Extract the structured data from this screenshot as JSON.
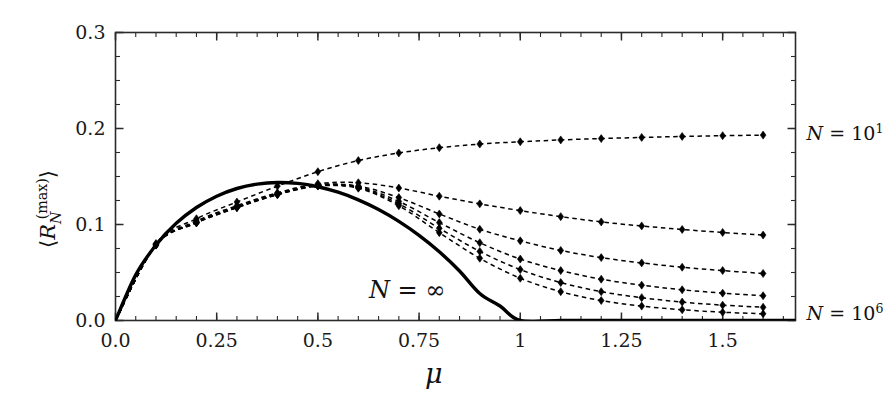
{
  "chart_data": {
    "type": "line",
    "title": "",
    "subtitle": "",
    "xlabel": "μ",
    "ylabel": "⟨R_N^(max)⟩",
    "xlim": [
      0.0,
      1.68
    ],
    "ylim": [
      0.0,
      0.3
    ],
    "xticks": [
      0.0,
      0.25,
      0.5,
      0.75,
      1.0,
      1.25,
      1.5
    ],
    "xtick_labels": [
      "0.0",
      "0.25",
      "0.5",
      "0.75",
      "1",
      "1.25",
      "1.5"
    ],
    "yticks": [
      0.0,
      0.1,
      0.2,
      0.3
    ],
    "ytick_labels": [
      "0.0",
      "0.1",
      "0.2",
      "0.3"
    ],
    "x_minor_step": 0.05,
    "y_minor_step": 0.025,
    "grid": false,
    "legend_position": "inline-right",
    "annotations": [
      {
        "text_prefix": "N",
        "text_eq": " = ",
        "text_value": "∞",
        "x": 0.72,
        "y": 0.032,
        "name": "n-infinity-annotation"
      },
      {
        "text_prefix": "N",
        "text_eq": " = ",
        "text_value": "10",
        "exponent": "1",
        "x": 1.7,
        "y": 0.196,
        "name": "n-10e1-annotation"
      },
      {
        "text_prefix": "N",
        "text_eq": " = ",
        "text_value": "10",
        "exponent": "6",
        "x": 1.7,
        "y": 0.008,
        "name": "n-10e6-annotation"
      }
    ],
    "x": [
      0.0,
      0.1,
      0.2,
      0.3,
      0.4,
      0.5,
      0.6,
      0.7,
      0.8,
      0.9,
      1.0,
      1.1,
      1.2,
      1.3,
      1.4,
      1.5,
      1.6
    ],
    "series": [
      {
        "name": "N = ∞",
        "style": "solid",
        "marker": "none",
        "color": "#000000",
        "linewidth": 3.4,
        "x": [
          0.0,
          0.05,
          0.1,
          0.15,
          0.2,
          0.25,
          0.3,
          0.35,
          0.4,
          0.45,
          0.5,
          0.55,
          0.6,
          0.65,
          0.7,
          0.75,
          0.8,
          0.85,
          0.9,
          0.95,
          1.0,
          1.1,
          1.2,
          1.3,
          1.4,
          1.5,
          1.6,
          1.68
        ],
        "values": [
          0.0,
          0.0475,
          0.0786,
          0.1012,
          0.1177,
          0.1295,
          0.1375,
          0.1421,
          0.1438,
          0.1428,
          0.1393,
          0.1336,
          0.1257,
          0.1156,
          0.1033,
          0.0887,
          0.0716,
          0.0516,
          0.0281,
          0.0151,
          0.0,
          0.0,
          0.0,
          0.0,
          0.0,
          0.0,
          0.0,
          0.0
        ]
      },
      {
        "name": "N = 10¹",
        "style": "dashed",
        "marker": "diamond",
        "color": "#000000",
        "values": [
          0.0,
          0.0802,
          0.106,
          0.1234,
          0.14,
          0.155,
          0.1666,
          0.1745,
          0.18,
          0.1838,
          0.1862,
          0.1881,
          0.1895,
          0.1907,
          0.1917,
          0.1925,
          0.1931
        ]
      },
      {
        "name": "N = 10²",
        "style": "dashed",
        "marker": "diamond",
        "color": "#000000",
        "values": [
          0.0,
          0.079,
          0.1035,
          0.1196,
          0.133,
          0.1425,
          0.1435,
          0.138,
          0.1295,
          0.1215,
          0.1145,
          0.1082,
          0.1027,
          0.0985,
          0.0948,
          0.0917,
          0.089
        ]
      },
      {
        "name": "N = 10³",
        "style": "dashed",
        "marker": "diamond",
        "color": "#000000",
        "values": [
          0.0,
          0.0788,
          0.1025,
          0.1185,
          0.132,
          0.1415,
          0.14,
          0.128,
          0.111,
          0.095,
          0.083,
          0.073,
          0.0655,
          0.06,
          0.0555,
          0.052,
          0.049
        ]
      },
      {
        "name": "N = 10⁴",
        "style": "dashed",
        "marker": "diamond",
        "color": "#000000",
        "values": [
          0.0,
          0.0786,
          0.102,
          0.118,
          0.1315,
          0.1408,
          0.1392,
          0.124,
          0.102,
          0.081,
          0.064,
          0.052,
          0.043,
          0.0368,
          0.032,
          0.0285,
          0.0258
        ]
      },
      {
        "name": "N = 10⁵",
        "style": "dashed",
        "marker": "diamond",
        "color": "#000000",
        "values": [
          0.0,
          0.0786,
          0.1018,
          0.1177,
          0.1312,
          0.1404,
          0.1385,
          0.1215,
          0.096,
          0.072,
          0.053,
          0.0395,
          0.03,
          0.0238,
          0.0192,
          0.016,
          0.0138
        ]
      },
      {
        "name": "N = 10⁶",
        "style": "dashed",
        "marker": "diamond",
        "color": "#000000",
        "values": [
          0.0,
          0.0786,
          0.1016,
          0.1175,
          0.131,
          0.14,
          0.1378,
          0.1195,
          0.0915,
          0.0648,
          0.044,
          0.03,
          0.0208,
          0.015,
          0.0112,
          0.0086,
          0.007
        ]
      }
    ]
  },
  "axes": {
    "xlabel": "μ",
    "ylabel_left_bracket": "⟨",
    "ylabel_symbol": "R",
    "ylabel_sub": "N",
    "ylabel_sup": "(max)",
    "ylabel_right_bracket": "⟩"
  },
  "colors": {
    "line": "#000000",
    "frame": "#2b2b2b",
    "text": "#111111",
    "background": "#ffffff"
  }
}
